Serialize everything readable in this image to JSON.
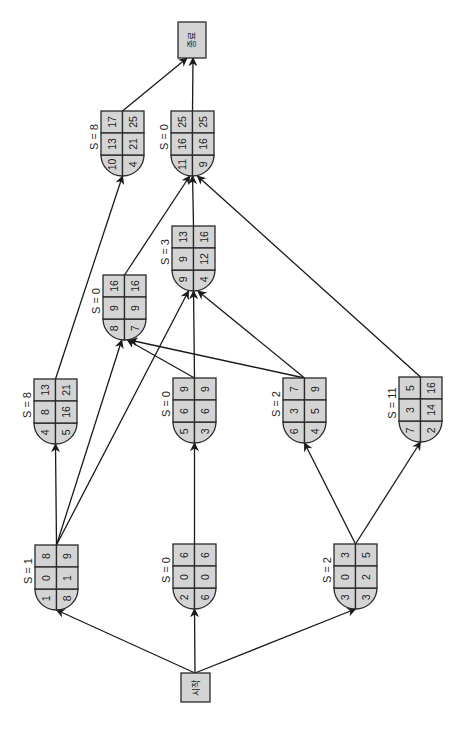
{
  "diagram": {
    "orientation": "rotated 90° counter-clockwise",
    "start_label": "시작",
    "end_label": "종료",
    "colors": {
      "node_fill": "#d4d4d4",
      "stroke": "#2a2a2a"
    },
    "nodes": [
      {
        "id": "A",
        "slack": "S = 1",
        "cells": [
          "1",
          "0",
          "8",
          "8",
          "1",
          "9"
        ]
      },
      {
        "id": "B",
        "slack": "S = 0",
        "cells": [
          "2",
          "0",
          "6",
          "6",
          "0",
          "6"
        ]
      },
      {
        "id": "C",
        "slack": "S = 2",
        "cells": [
          "3",
          "0",
          "3",
          "3",
          "2",
          "5"
        ]
      },
      {
        "id": "D",
        "slack": "S = 8",
        "cells": [
          "4",
          "8",
          "13",
          "5",
          "16",
          "21"
        ]
      },
      {
        "id": "E",
        "slack": "S = 0",
        "cells": [
          "5",
          "6",
          "9",
          "3",
          "6",
          "9"
        ]
      },
      {
        "id": "F",
        "slack": "S = 2",
        "cells": [
          "6",
          "3",
          "7",
          "4",
          "5",
          "9"
        ]
      },
      {
        "id": "G",
        "slack": "S = 11",
        "cells": [
          "7",
          "3",
          "5",
          "2",
          "14",
          "16"
        ]
      },
      {
        "id": "H",
        "slack": "S = 0",
        "cells": [
          "8",
          "9",
          "16",
          "7",
          "9",
          "16"
        ]
      },
      {
        "id": "I",
        "slack": "S = 3",
        "cells": [
          "9",
          "9",
          "13",
          "4",
          "12",
          "16"
        ]
      },
      {
        "id": "J",
        "slack": "S = 8",
        "cells": [
          "10",
          "13",
          "17",
          "4",
          "21",
          "25"
        ]
      },
      {
        "id": "K",
        "slack": "S = 0",
        "cells": [
          "11",
          "16",
          "25",
          "9",
          "16",
          "25"
        ]
      }
    ],
    "edges": [
      [
        "start",
        "A"
      ],
      [
        "start",
        "B"
      ],
      [
        "start",
        "C"
      ],
      [
        "A",
        "D"
      ],
      [
        "A",
        "H"
      ],
      [
        "A",
        "I"
      ],
      [
        "B",
        "E"
      ],
      [
        "C",
        "F"
      ],
      [
        "C",
        "G"
      ],
      [
        "D",
        "J"
      ],
      [
        "E",
        "H"
      ],
      [
        "E",
        "I"
      ],
      [
        "F",
        "H"
      ],
      [
        "F",
        "I"
      ],
      [
        "G",
        "K"
      ],
      [
        "H",
        "K"
      ],
      [
        "I",
        "K"
      ],
      [
        "J",
        "end"
      ],
      [
        "K",
        "end"
      ]
    ]
  }
}
